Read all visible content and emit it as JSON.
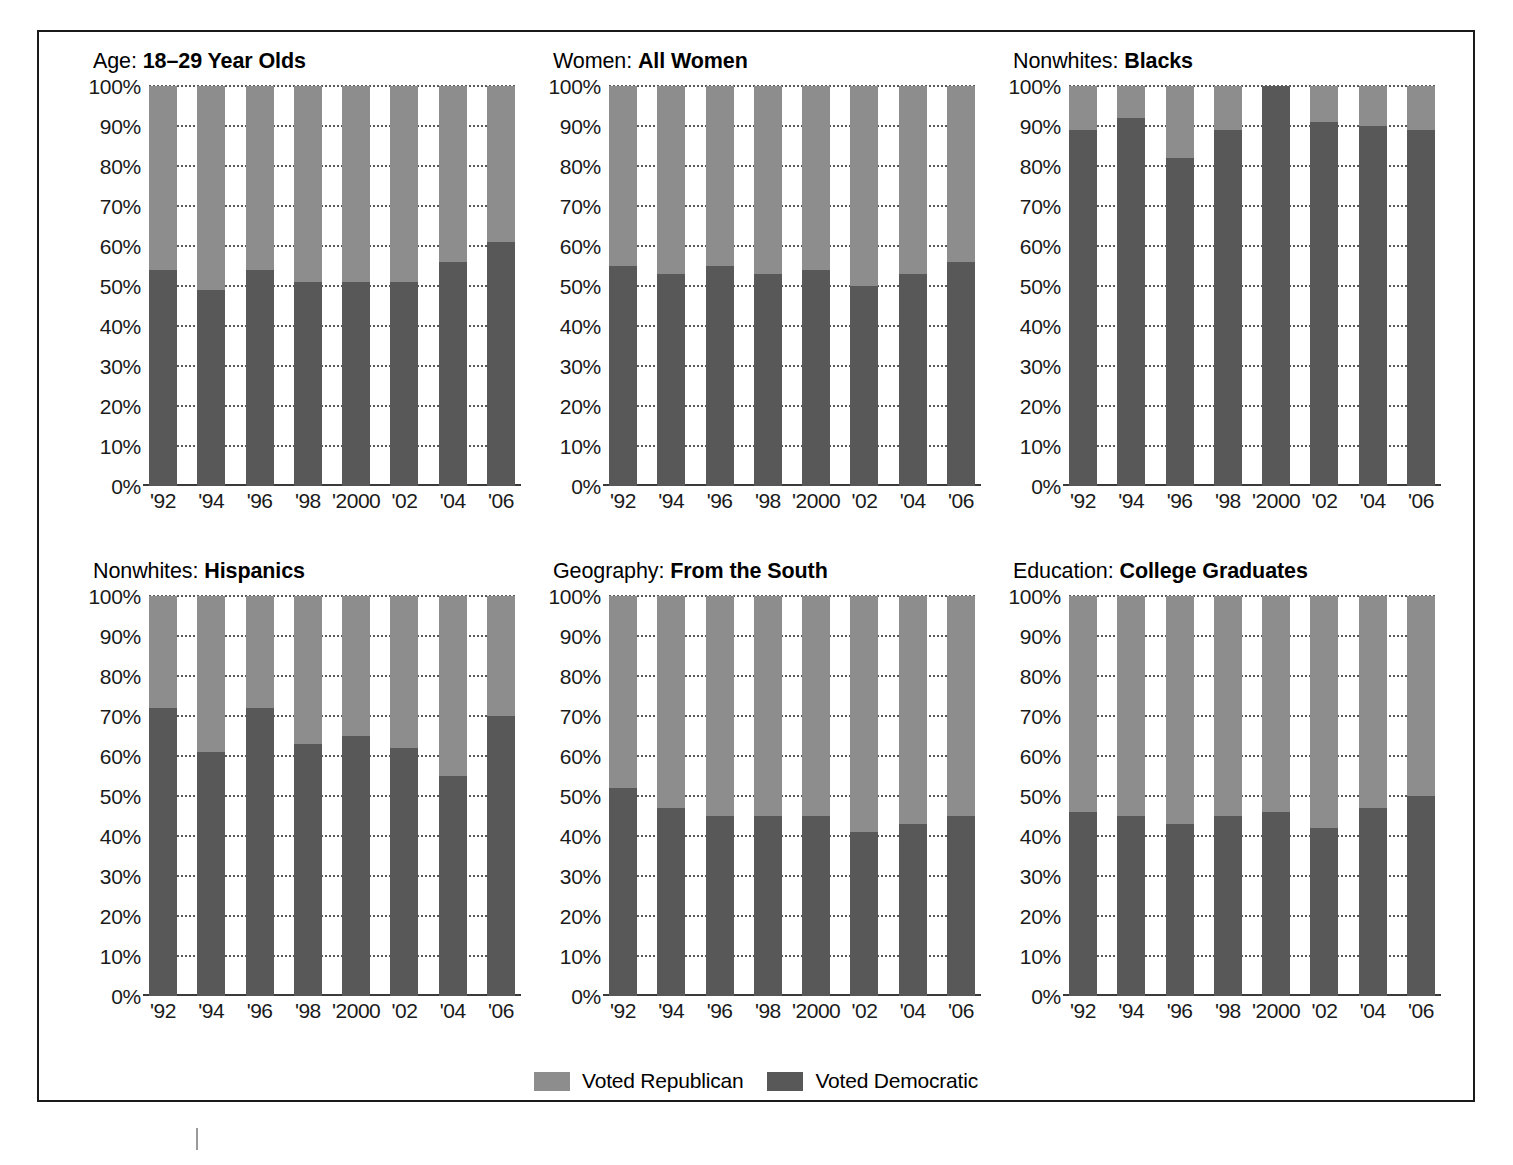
{
  "chart_data": {
    "type": "bar",
    "subtype": "stacked-100-percent",
    "title": "",
    "categories": [
      "'92",
      "'94",
      "'96",
      "'98",
      "'2000",
      "'02",
      "'04",
      "'06"
    ],
    "ylabel": "",
    "xlabel": "",
    "ylim": [
      0,
      100
    ],
    "ytick_labels": [
      "100%",
      "90%",
      "80%",
      "70%",
      "60%",
      "50%",
      "40%",
      "30%",
      "20%",
      "10%",
      "0%"
    ],
    "ytick_values": [
      100,
      90,
      80,
      70,
      60,
      50,
      40,
      30,
      20,
      10,
      0
    ],
    "grid": true,
    "grid_style": "dotted-horizontal",
    "legend_position": "bottom-center",
    "legend": [
      {
        "name": "Voted Republican",
        "color": "#8d8d8d"
      },
      {
        "name": "Voted Democratic",
        "color": "#585858"
      }
    ],
    "panels": [
      {
        "title_prefix": "Age:",
        "title_bold": "18–29 Year Olds",
        "series": [
          {
            "name": "Voted Democratic",
            "values": [
              54,
              49,
              54,
              51,
              51,
              51,
              56,
              61
            ]
          },
          {
            "name": "Voted Republican",
            "values": [
              46,
              51,
              46,
              49,
              49,
              49,
              44,
              39
            ]
          }
        ]
      },
      {
        "title_prefix": "Women:",
        "title_bold": "All Women",
        "series": [
          {
            "name": "Voted Democratic",
            "values": [
              55,
              53,
              55,
              53,
              54,
              50,
              53,
              56
            ]
          },
          {
            "name": "Voted Republican",
            "values": [
              45,
              47,
              45,
              47,
              46,
              50,
              47,
              44
            ]
          }
        ]
      },
      {
        "title_prefix": "Nonwhites:",
        "title_bold": "Blacks",
        "series": [
          {
            "name": "Voted Democratic",
            "values": [
              89,
              92,
              82,
              89,
              100,
              91,
              90,
              89
            ]
          },
          {
            "name": "Voted Republican",
            "values": [
              11,
              8,
              18,
              11,
              0,
              9,
              10,
              11
            ]
          }
        ]
      },
      {
        "title_prefix": "Nonwhites:",
        "title_bold": "Hispanics",
        "series": [
          {
            "name": "Voted Democratic",
            "values": [
              72,
              61,
              72,
              63,
              65,
              62,
              55,
              70
            ]
          },
          {
            "name": "Voted Republican",
            "values": [
              28,
              39,
              28,
              37,
              35,
              38,
              45,
              30
            ]
          }
        ]
      },
      {
        "title_prefix": "Geography:",
        "title_bold": "From the South",
        "series": [
          {
            "name": "Voted Democratic",
            "values": [
              52,
              47,
              45,
              45,
              45,
              41,
              43,
              45
            ]
          },
          {
            "name": "Voted Republican",
            "values": [
              48,
              53,
              55,
              55,
              55,
              59,
              57,
              55
            ]
          }
        ]
      },
      {
        "title_prefix": "Education:",
        "title_bold": "College Graduates",
        "series": [
          {
            "name": "Voted Democratic",
            "values": [
              46,
              45,
              43,
              45,
              46,
              42,
              47,
              50
            ]
          },
          {
            "name": "Voted Republican",
            "values": [
              54,
              55,
              57,
              55,
              54,
              58,
              53,
              50
            ]
          }
        ]
      }
    ]
  },
  "colors": {
    "republican": "#8d8d8d",
    "democratic": "#585858",
    "frame": "#1a1a1a",
    "gridline": "#5a5a5a",
    "text": "#000000"
  }
}
